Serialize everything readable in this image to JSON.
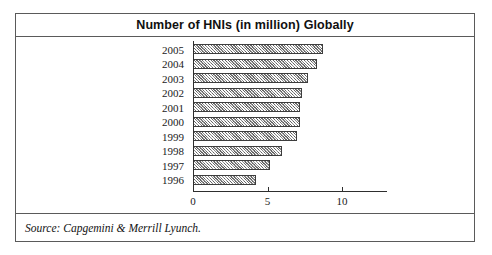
{
  "figure": {
    "title": "Number of HNIs (in million) Globally",
    "source_note": "Source: Capgemini & Merrill Lyunch."
  },
  "chart_data": {
    "type": "bar",
    "orientation": "horizontal",
    "title": "Number of HNIs (in million) Globally",
    "xlabel": "",
    "ylabel": "",
    "xlim": [
      0,
      10
    ],
    "xticks": [
      "0",
      "5",
      "10"
    ],
    "xtick_values": [
      0,
      5,
      10
    ],
    "grid": false,
    "legend": false,
    "categories": [
      "2005",
      "2004",
      "2003",
      "2002",
      "2001",
      "2000",
      "1999",
      "1998",
      "1997",
      "1996"
    ],
    "values": [
      8.7,
      8.3,
      7.7,
      7.3,
      7.2,
      7.2,
      7.0,
      6.0,
      5.2,
      4.2
    ],
    "series": [
      {
        "name": "Number of HNIs (in million)",
        "values": [
          8.7,
          8.3,
          7.7,
          7.3,
          7.2,
          7.2,
          7.0,
          6.0,
          5.2,
          4.2
        ]
      }
    ]
  },
  "style": {
    "bar_fill": "#b9b9b9",
    "bar_border": "#3d3d3d",
    "frame_color": "#5a5a5a",
    "axis_color": "#2e2e2e",
    "text_color": "#1a1a1a"
  }
}
